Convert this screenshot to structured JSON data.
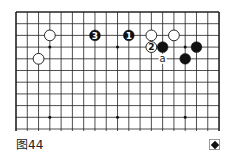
{
  "figure": {
    "caption": "图44",
    "icon": "diamond-box-icon"
  },
  "board": {
    "columns": 19,
    "rows_shown": 11,
    "origin": {
      "x": 16,
      "y": 12
    },
    "spacing": {
      "x": 11.28,
      "y": 11.7
    },
    "bottom_extent": 131,
    "edges": {
      "top": true,
      "left": true,
      "right": true,
      "bottom": false
    },
    "line_color": "#222222",
    "star_points": [
      {
        "col": 3,
        "row": 3
      },
      {
        "col": 9,
        "row": 3
      },
      {
        "col": 15,
        "row": 3
      },
      {
        "col": 3,
        "row": 9
      },
      {
        "col": 9,
        "row": 9
      },
      {
        "col": 15,
        "row": 9
      }
    ],
    "stones": [
      {
        "color": "white",
        "col": 3,
        "row": 2,
        "label": ""
      },
      {
        "color": "white",
        "col": 2,
        "row": 4,
        "label": ""
      },
      {
        "color": "black",
        "col": 7,
        "row": 2,
        "label": "3"
      },
      {
        "color": "black",
        "col": 10,
        "row": 2,
        "label": "1"
      },
      {
        "color": "white",
        "col": 12,
        "row": 2,
        "label": ""
      },
      {
        "color": "white",
        "col": 14,
        "row": 2,
        "label": ""
      },
      {
        "color": "white",
        "col": 12,
        "row": 3,
        "label": "2"
      },
      {
        "color": "black",
        "col": 13,
        "row": 3,
        "label": ""
      },
      {
        "color": "black",
        "col": 16,
        "row": 3,
        "label": ""
      },
      {
        "color": "black",
        "col": 15,
        "row": 4,
        "label": ""
      }
    ],
    "markers": [
      {
        "col": 13,
        "row": 4,
        "label": "a"
      }
    ]
  }
}
